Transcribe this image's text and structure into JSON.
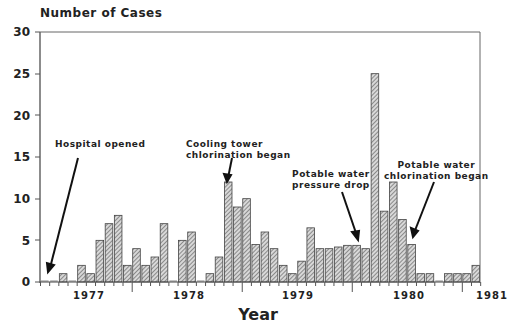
{
  "chart_data": {
    "type": "bar",
    "title": "",
    "ylabel": "Number of Cases",
    "xlabel": "Year",
    "ylim": [
      0,
      30
    ],
    "yticks": [
      0,
      5,
      10,
      15,
      20,
      25,
      30
    ],
    "xtick_labels": [
      "1977",
      "1978",
      "1979",
      "1980",
      "1981"
    ],
    "grid": false,
    "bin": "month",
    "categories": [
      "M1",
      "M2",
      "M3",
      "M4",
      "M5",
      "M6",
      "M7",
      "M8",
      "M9",
      "M10",
      "M11",
      "M12",
      "M13",
      "M14",
      "M15",
      "M16",
      "M17",
      "M18",
      "M19",
      "M20",
      "M21",
      "M22",
      "M23",
      "M24",
      "M25",
      "M26",
      "M27",
      "M28",
      "M29",
      "M30",
      "M31",
      "M32",
      "M33",
      "M34",
      "M35",
      "M36",
      "M37",
      "M38",
      "M39",
      "M40",
      "M41",
      "M42",
      "M43",
      "M44",
      "M45",
      "M46",
      "M47",
      "M48"
    ],
    "values": [
      0,
      0,
      1,
      0,
      2,
      1,
      5,
      7,
      8,
      2,
      4,
      2,
      3,
      7,
      0,
      5,
      6,
      0,
      1,
      3,
      12,
      9,
      10,
      4.5,
      6,
      4,
      2,
      1,
      2.5,
      6.5,
      4,
      4,
      4.2,
      4.4,
      4.4,
      4,
      25,
      8.5,
      12,
      7.5,
      4.5,
      1,
      1,
      0,
      1,
      1,
      1,
      2
    ],
    "annotations": [
      {
        "text": "Hospital opened",
        "month_index": 1
      },
      {
        "text": "Cooling tower chlorination began",
        "month_index": 20
      },
      {
        "text": "Potable water pressure drop",
        "month_index": 35
      },
      {
        "text": "Potable water chlorination began",
        "month_index": 40
      }
    ]
  },
  "labels": {
    "ytitle": "Number of Cases",
    "xtitle": "Year",
    "y": [
      "30",
      "25",
      "20",
      "15",
      "10",
      "5",
      "0"
    ],
    "x": [
      "1977",
      "1978",
      "1979",
      "1980",
      "1981"
    ],
    "annot_hospital": "Hospital opened",
    "annot_cooling_1": "Cooling tower",
    "annot_cooling_2": "chlorination began",
    "annot_pressure_1": "Potable water",
    "annot_pressure_2": "pressure drop",
    "annot_potable_1": "Potable water",
    "annot_potable_2": "chlorination began"
  }
}
